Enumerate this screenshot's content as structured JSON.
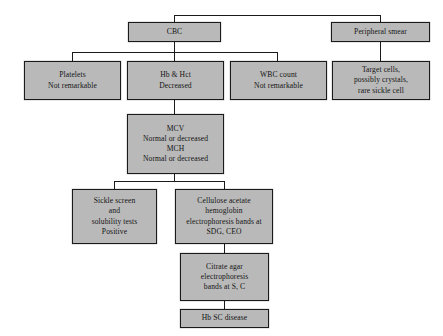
{
  "diagram": {
    "background_color": "#ffffff",
    "node_fill_color": "#b9b9b9",
    "node_border_color": "#1a1a1a",
    "connector_color": "#1a1a1a",
    "nodes": {
      "cbc": {
        "lines": [
          "CBC"
        ],
        "line1": "CBC"
      },
      "peripheral_smear": {
        "lines": [
          "Peripheral smear"
        ],
        "line1": "Peripheral smear"
      },
      "platelets": {
        "lines": [
          "Platelets",
          "Not remarkable"
        ],
        "line1": "Platelets",
        "line2": "Not remarkable"
      },
      "hb_hct": {
        "lines": [
          "Hb & Hct",
          "Decreased"
        ],
        "line1": "Hb & Hct",
        "line2": "Decreased"
      },
      "wbc_count": {
        "lines": [
          "WBC count",
          "Not remarkable"
        ],
        "line1": "WBC count",
        "line2": "Not remarkable"
      },
      "target_cells": {
        "lines": [
          "Target cells,",
          "possibly crystals,",
          "rare sickle cell"
        ],
        "line1": "Target cells,",
        "line2": "possibly crystals,",
        "line3": "rare sickle cell"
      },
      "mcv_mch": {
        "lines": [
          "MCV",
          "Normal or decreased",
          "MCH",
          "Normal or decreased"
        ],
        "line1": "MCV",
        "line2": "Normal or decreased",
        "line3": "MCH",
        "line4": "Normal or decreased"
      },
      "sickle_screen": {
        "lines": [
          "Sickle screen",
          "and",
          "solubility tests",
          "Positive"
        ],
        "line1": "Sickle screen",
        "line2": "and",
        "line3": "solubility tests",
        "line4": "Positive"
      },
      "cellulose_acetate": {
        "lines": [
          "Cellulose acetate",
          "hemoglobin",
          "electrophoresis bands at",
          "SDG, CEO"
        ],
        "line1": "Cellulose acetate",
        "line2": "hemoglobin",
        "line3": "electrophoresis bands at",
        "line4": "SDG, CEO"
      },
      "citrate_agar": {
        "lines": [
          "Citrate agar",
          "electrophoresis",
          "bands at S, C"
        ],
        "line1": "Citrate agar",
        "line2": "electrophoresis",
        "line3": "bands at S, C"
      },
      "diagnosis": {
        "lines": [
          "Hb SC disease"
        ],
        "line1": "Hb SC disease"
      }
    }
  }
}
